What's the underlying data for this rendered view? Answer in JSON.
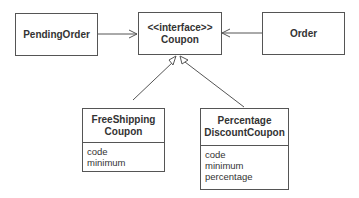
{
  "diagram": {
    "type": "UML class diagram",
    "classes": {
      "pending_order": {
        "name": "PendingOrder"
      },
      "coupon": {
        "stereotype": "<<interface>>",
        "name": "Coupon"
      },
      "order": {
        "name": "Order"
      },
      "free_shipping": {
        "name_line1": "FreeShipping",
        "name_line2": "Coupon",
        "attributes": [
          "code",
          "minimum"
        ]
      },
      "percentage_discount": {
        "name_line1": "Percentage",
        "name_line2": "DiscountCoupon",
        "attributes": [
          "code",
          "minimum",
          "percentage"
        ]
      }
    },
    "relationships": [
      {
        "from": "PendingOrder",
        "to": "Coupon",
        "type": "association"
      },
      {
        "from": "Order",
        "to": "Coupon",
        "type": "association"
      },
      {
        "from": "FreeShippingCoupon",
        "to": "Coupon",
        "type": "realization"
      },
      {
        "from": "PercentageDiscountCoupon",
        "to": "Coupon",
        "type": "realization"
      }
    ]
  }
}
